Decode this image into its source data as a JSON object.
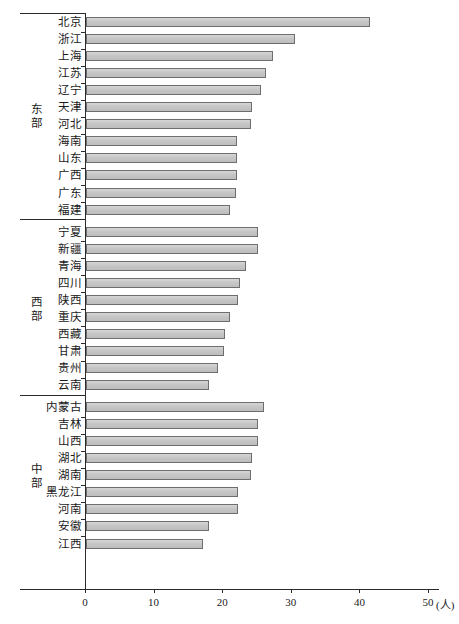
{
  "chart_data": {
    "type": "bar",
    "orientation": "horizontal",
    "title": "",
    "xlabel": "(人)",
    "ylabel": "",
    "xlim": [
      0,
      50
    ],
    "xticks": [
      0,
      10,
      20,
      30,
      40,
      50
    ],
    "xtick_labels": [
      "0",
      "10",
      "20",
      "30",
      "40",
      "50"
    ],
    "unit": "(人)",
    "grid": false,
    "legend": "none",
    "groups": [
      {
        "name": "东部",
        "categories": [
          "北京",
          "浙江",
          "上海",
          "江苏",
          "辽宁",
          "天津",
          "河北",
          "海南",
          "山东",
          "广西",
          "广东",
          "福建"
        ],
        "values": [
          41.4,
          30.4,
          27.2,
          26.3,
          25.5,
          24.2,
          24.1,
          22.0,
          22.0,
          22.0,
          21.9,
          21.0
        ]
      },
      {
        "name": "西部",
        "categories": [
          "宁夏",
          "新疆",
          "青海",
          "四川",
          "陕西",
          "重庆",
          "西藏",
          "甘肃",
          "贵州",
          "云南"
        ],
        "values": [
          25.1,
          25.0,
          23.3,
          22.5,
          22.1,
          21.0,
          20.3,
          20.1,
          19.2,
          18.0
        ]
      },
      {
        "name": "中部",
        "categories": [
          "内蒙古",
          "吉林",
          "山西",
          "湖北",
          "湖南",
          "黑龙江",
          "河南",
          "安徽",
          "江西"
        ],
        "values": [
          26.0,
          25.1,
          25.0,
          24.2,
          24.0,
          22.2,
          22.2,
          18.0,
          17.0
        ]
      }
    ]
  },
  "style": {
    "bar_fill": "#c9c9c9",
    "bar_border": "#6e6e6e",
    "axis_color": "#2b2b2b",
    "text_color": "#1a1a1a"
  }
}
